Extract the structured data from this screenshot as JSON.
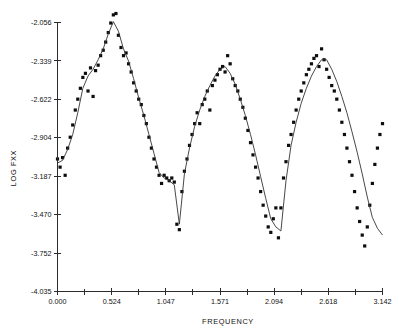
{
  "chart_data": {
    "type": "scatter",
    "title": "",
    "xlabel": "FREQUENCY",
    "ylabel": "LOG FXX",
    "xlim": [
      0.0,
      3.142
    ],
    "ylim": [
      -4.035,
      -2.056
    ],
    "grid": false,
    "legend": null,
    "xticks": [
      "0.000",
      "0.524",
      "1.047",
      "1.571",
      "2.094",
      "2.618",
      "3.142"
    ],
    "xtick_values": [
      0.0,
      0.524,
      1.047,
      1.571,
      2.094,
      2.618,
      3.142
    ],
    "minor_xticks_between": 1,
    "yticks": [
      "-2.056",
      "-2.339",
      "-2.622",
      "-2.904",
      "-3.187",
      "-3.470",
      "-3.752",
      "-4.035"
    ],
    "ytick_values": [
      -2.056,
      -2.339,
      -2.622,
      -2.904,
      -3.187,
      -3.47,
      -3.752,
      -4.035
    ],
    "series": [
      {
        "name": "periodogram",
        "marker": "square",
        "x": [
          0.0,
          0.025,
          0.049,
          0.074,
          0.098,
          0.123,
          0.147,
          0.172,
          0.196,
          0.221,
          0.245,
          0.27,
          0.295,
          0.319,
          0.344,
          0.368,
          0.393,
          0.417,
          0.442,
          0.466,
          0.491,
          0.515,
          0.54,
          0.565,
          0.589,
          0.614,
          0.638,
          0.663,
          0.687,
          0.712,
          0.736,
          0.761,
          0.785,
          0.81,
          0.835,
          0.859,
          0.884,
          0.908,
          0.933,
          0.957,
          0.982,
          1.006,
          1.031,
          1.056,
          1.08,
          1.105,
          1.129,
          1.154,
          1.178,
          1.203,
          1.227,
          1.252,
          1.276,
          1.301,
          1.326,
          1.35,
          1.375,
          1.399,
          1.424,
          1.448,
          1.473,
          1.497,
          1.522,
          1.546,
          1.571,
          1.596,
          1.62,
          1.645,
          1.669,
          1.694,
          1.718,
          1.743,
          1.767,
          1.792,
          1.816,
          1.841,
          1.866,
          1.89,
          1.915,
          1.939,
          1.964,
          1.988,
          2.013,
          2.037,
          2.062,
          2.086,
          2.111,
          2.136,
          2.16,
          2.185,
          2.209,
          2.234,
          2.258,
          2.283,
          2.307,
          2.332,
          2.356,
          2.381,
          2.406,
          2.43,
          2.455,
          2.479,
          2.504,
          2.528,
          2.553,
          2.577,
          2.602,
          2.626,
          2.651,
          2.676,
          2.7,
          2.725,
          2.749,
          2.774,
          2.798,
          2.823,
          2.847,
          2.872,
          2.897,
          2.921,
          2.946,
          2.97,
          2.995,
          3.019,
          3.044,
          3.068,
          3.093,
          3.117,
          3.142
        ],
        "y": [
          -3.06,
          -3.12,
          -3.05,
          -3.18,
          -2.98,
          -2.9,
          -2.81,
          -2.7,
          -2.62,
          -2.54,
          -2.46,
          -2.43,
          -2.56,
          -2.39,
          -2.6,
          -2.41,
          -2.37,
          -2.3,
          -2.26,
          -2.2,
          -2.13,
          -2.06,
          -2.0,
          -1.99,
          -2.15,
          -2.24,
          -2.3,
          -2.28,
          -2.36,
          -2.42,
          -2.5,
          -2.56,
          -2.62,
          -2.66,
          -2.74,
          -2.8,
          -2.9,
          -2.98,
          -3.06,
          -3.12,
          -3.18,
          -3.24,
          -3.18,
          -3.2,
          -3.22,
          -3.2,
          -3.23,
          -3.54,
          -3.58,
          -3.3,
          -3.15,
          -3.06,
          -2.96,
          -2.88,
          -2.8,
          -2.72,
          -2.8,
          -2.66,
          -2.62,
          -2.56,
          -2.7,
          -2.52,
          -2.48,
          -2.44,
          -2.4,
          -2.38,
          -2.42,
          -2.3,
          -2.36,
          -2.47,
          -2.52,
          -2.56,
          -2.62,
          -2.68,
          -2.76,
          -2.85,
          -2.94,
          -3.03,
          -3.12,
          -3.2,
          -3.3,
          -3.4,
          -3.48,
          -3.56,
          -3.6,
          -3.5,
          -3.42,
          -3.64,
          -3.42,
          -3.2,
          -3.08,
          -2.96,
          -2.88,
          -2.79,
          -2.7,
          -2.62,
          -2.56,
          -2.5,
          -2.44,
          -2.4,
          -2.36,
          -2.32,
          -2.3,
          -2.38,
          -2.25,
          -2.33,
          -2.4,
          -2.46,
          -2.52,
          -2.56,
          -2.62,
          -2.7,
          -2.79,
          -2.88,
          -2.98,
          -3.08,
          -3.18,
          -3.3,
          -3.42,
          -3.52,
          -3.62,
          -3.7,
          -3.56,
          -3.4,
          -3.24,
          -3.1,
          -2.98,
          -2.88,
          -2.8
        ]
      },
      {
        "name": "smoothed spectrum",
        "marker": "line",
        "x": [
          0.0,
          0.049,
          0.098,
          0.147,
          0.196,
          0.245,
          0.295,
          0.344,
          0.393,
          0.442,
          0.491,
          0.54,
          0.589,
          0.638,
          0.687,
          0.736,
          0.785,
          0.835,
          0.884,
          0.933,
          0.982,
          1.031,
          1.08,
          1.129,
          1.178,
          1.227,
          1.276,
          1.326,
          1.375,
          1.424,
          1.473,
          1.522,
          1.571,
          1.62,
          1.669,
          1.718,
          1.767,
          1.816,
          1.866,
          1.915,
          1.964,
          2.013,
          2.062,
          2.111,
          2.16,
          2.209,
          2.258,
          2.307,
          2.356,
          2.406,
          2.455,
          2.504,
          2.553,
          2.602,
          2.651,
          2.7,
          2.749,
          2.798,
          2.847,
          2.897,
          2.946,
          2.995,
          3.044,
          3.093,
          3.142
        ],
        "y": [
          -3.09,
          -3.07,
          -2.99,
          -2.88,
          -2.72,
          -2.54,
          -2.45,
          -2.4,
          -2.33,
          -2.25,
          -2.14,
          -2.05,
          -2.12,
          -2.25,
          -2.34,
          -2.47,
          -2.61,
          -2.74,
          -2.88,
          -3.02,
          -3.16,
          -3.2,
          -3.22,
          -3.25,
          -3.54,
          -3.17,
          -2.98,
          -2.82,
          -2.7,
          -2.6,
          -2.52,
          -2.45,
          -2.4,
          -2.38,
          -2.43,
          -2.51,
          -2.62,
          -2.74,
          -2.88,
          -3.03,
          -3.19,
          -3.35,
          -3.5,
          -3.56,
          -3.59,
          -3.22,
          -2.96,
          -2.79,
          -2.65,
          -2.54,
          -2.45,
          -2.38,
          -2.33,
          -2.33,
          -2.4,
          -2.49,
          -2.6,
          -2.72,
          -2.86,
          -3.01,
          -3.17,
          -3.34,
          -3.49,
          -3.57,
          -3.62
        ]
      }
    ]
  },
  "axes": {
    "x_title": "FREQUENCY",
    "y_title": "LOG FXX"
  }
}
